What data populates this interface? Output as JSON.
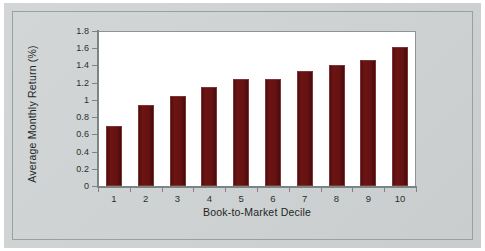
{
  "figure": {
    "background_color": "#cfd3d3",
    "plot_background_color": "#ffffff",
    "bar_color": "#651212",
    "axis_color": "#7e8484",
    "frame_color": "#9aa0a0"
  },
  "chart_data": {
    "type": "bar",
    "title": "",
    "xlabel": "Book-to-Market Decile",
    "ylabel": "Average Monthly Return (%)",
    "categories": [
      "1",
      "2",
      "3",
      "4",
      "5",
      "6",
      "7",
      "8",
      "9",
      "10"
    ],
    "values": [
      0.7,
      0.94,
      1.05,
      1.15,
      1.24,
      1.24,
      1.34,
      1.41,
      1.46,
      1.62
    ],
    "ylim": [
      0,
      1.8
    ],
    "ytick_labels": [
      "0",
      "0.2",
      "0.4",
      "0.6",
      "0.8",
      "1",
      "1.2",
      "1.4",
      "1.6",
      "1.8"
    ],
    "ytick_values": [
      0,
      0.2,
      0.4,
      0.6,
      0.8,
      1.0,
      1.2,
      1.4,
      1.6,
      1.8
    ],
    "grid": false,
    "legend": null,
    "legend_position": "none",
    "series": [
      {
        "name": "Average Monthly Return (%)",
        "values": [
          0.7,
          0.94,
          1.05,
          1.15,
          1.24,
          1.24,
          1.34,
          1.41,
          1.46,
          1.62
        ]
      }
    ]
  }
}
